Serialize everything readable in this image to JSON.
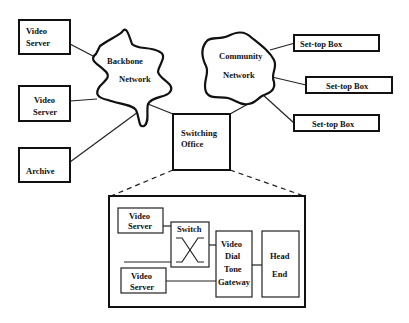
{
  "diagram": {
    "top": {
      "video_server_1": [
        "Video",
        "Server"
      ],
      "video_server_2": [
        "Video",
        "Server"
      ],
      "archive": "Archive",
      "backbone_network": [
        "Backbone",
        "Network"
      ],
      "community_network": [
        "Community",
        "Network"
      ],
      "switching_office": [
        "Switching",
        "Office"
      ],
      "set_top_boxes": [
        "Set-top Box",
        "Set-top Box",
        "Set-top Box"
      ]
    },
    "detail": {
      "video_server_a": [
        "Video",
        "Server"
      ],
      "video_server_b": [
        "Video",
        "Server"
      ],
      "switch": "Switch",
      "gateway": [
        "Video",
        "Dial",
        "Tone",
        "Gateway"
      ],
      "head_end": [
        "Head",
        "End"
      ]
    }
  }
}
